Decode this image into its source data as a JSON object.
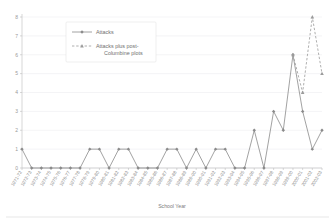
{
  "chart_data": {
    "type": "line",
    "title": "",
    "xlabel": "School Year",
    "ylabel": "",
    "ylim": [
      0,
      8
    ],
    "yticks": [
      0,
      1,
      2,
      3,
      4,
      5,
      6,
      7,
      8
    ],
    "grid": true,
    "legend_position": "top-center",
    "categories": [
      "1971-72",
      "1972-73",
      "1973-74",
      "1974-75",
      "1975-76",
      "1976-77",
      "1977-78",
      "1978-79",
      "1979-80",
      "1980-81",
      "1981-82",
      "1982-83",
      "1983-84",
      "1984-85",
      "1985-86",
      "1986-87",
      "1987-88",
      "1988-89",
      "1989-90",
      "1990-91",
      "1991-92",
      "1992-93",
      "1993-94",
      "1994-95",
      "1995-96",
      "1996-97",
      "1997-98",
      "1998-99",
      "1999-00",
      "2000-01",
      "2001-02",
      "2002-03"
    ],
    "series": [
      {
        "name": "Attacks",
        "style": "solid",
        "marker": "diamond",
        "color": "#8a8a8a",
        "values": [
          1,
          0,
          0,
          0,
          0,
          0,
          0,
          1,
          1,
          0,
          1,
          1,
          0,
          0,
          0,
          1,
          1,
          0,
          1,
          0,
          1,
          1,
          0,
          0,
          2,
          0,
          3,
          2,
          6,
          3,
          1,
          2
        ]
      },
      {
        "name": "Attacks plus post-Columbine plots",
        "style": "dashed",
        "marker": "triangle",
        "color": "#9b9b9b",
        "values": [
          null,
          null,
          null,
          null,
          null,
          null,
          null,
          null,
          null,
          null,
          null,
          null,
          null,
          null,
          null,
          null,
          null,
          null,
          null,
          null,
          null,
          null,
          null,
          null,
          null,
          null,
          null,
          null,
          6,
          4,
          8,
          5
        ]
      }
    ]
  },
  "legend": {
    "entries": [
      {
        "label": "Attacks"
      },
      {
        "label": "Attacks plus post-",
        "label2": "Columbine plots"
      }
    ]
  },
  "axis": {
    "x_title": "School Year"
  }
}
